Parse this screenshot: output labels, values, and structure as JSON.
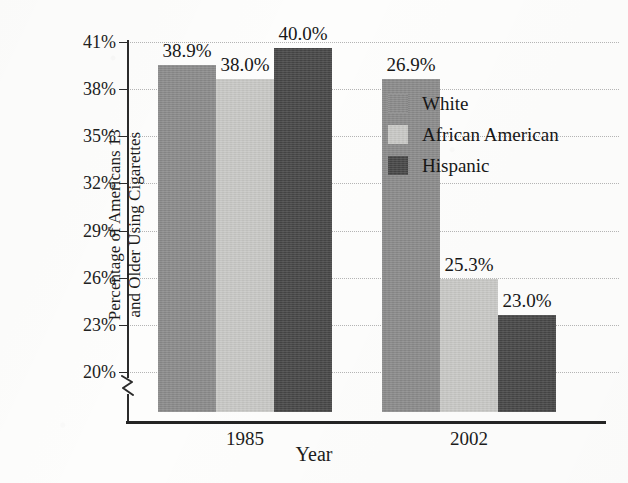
{
  "figure": {
    "cropped_title_fragment": "....",
    "background_color": "#fdfdfc"
  },
  "chart_data": {
    "type": "bar",
    "title": "",
    "xlabel": "Year",
    "ylabel": "Percentage of Americans 13 and Older Using Cigarettes",
    "ylabel_line1": "Percentage of Americans 13",
    "ylabel_line2": "and Older Using Cigarettes",
    "categories": [
      "1985",
      "2002"
    ],
    "series": [
      {
        "name": "White",
        "values": [
          38.9,
          38.0
        ],
        "color": "#8b8b8b"
      },
      {
        "name": "African American",
        "values": [
          38.0,
          25.3
        ],
        "color": "#c9c9c6"
      },
      {
        "name": "Hispanic",
        "values": [
          40.0,
          23.0
        ],
        "color": "#474747"
      }
    ],
    "value_labels": [
      [
        "38.9%",
        "38.0%",
        "40.0%"
      ],
      [
        "26.9%",
        "25.3%",
        "23.0%"
      ]
    ],
    "series_values_by_group": [
      {
        "group": "1985",
        "White": 38.9,
        "African American": 38.0,
        "Hispanic": 40.0
      },
      {
        "group": "2002",
        "White": 26.9,
        "African American": 25.3,
        "Hispanic": 23.0
      }
    ],
    "ylim": [
      20,
      41
    ],
    "ytick_values": [
      41,
      38,
      35,
      32,
      29,
      26,
      23,
      20
    ],
    "ytick_labels": [
      "41%",
      "38%",
      "35%",
      "32%",
      "29%",
      "26%",
      "23%",
      "20%"
    ],
    "axis_break": true,
    "axis_break_note": "y-axis broken below 20%",
    "grid": true,
    "grid_style": "dotted",
    "legend_position": "inside upper right",
    "bar_group_gap": true
  },
  "legend": {
    "items": [
      {
        "label": "White",
        "color": "#8b8b8b"
      },
      {
        "label": "African American",
        "color": "#c9c9c6"
      },
      {
        "label": "Hispanic",
        "color": "#474747"
      }
    ]
  },
  "axes": {
    "x_title": "Year",
    "x_tick_labels": [
      "1985",
      "2002"
    ],
    "y_tick_labels": [
      "41%",
      "38%",
      "35%",
      "32%",
      "29%",
      "26%",
      "23%",
      "20%"
    ]
  }
}
